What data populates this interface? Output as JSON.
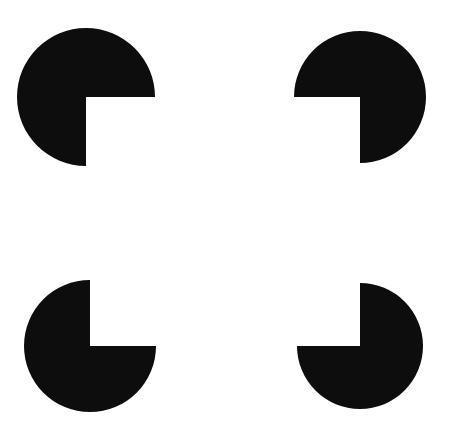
{
  "figure": {
    "type": "illusory-contour-figure",
    "canvas": {
      "width": 450,
      "height": 440,
      "background_color": "#ffffff"
    },
    "shape_color": "#0d0d0d",
    "inducer_count": 4,
    "wedge_angle_degrees": 90,
    "inducers": [
      {
        "name": "top-left",
        "label": "pacman-top-left",
        "center_x": 86,
        "center_y": 97,
        "radius": 69,
        "wedge_start_deg": 0,
        "wedge_end_deg": 90,
        "notch_corner_x": 86,
        "notch_corner_y": 97
      },
      {
        "name": "top-right",
        "label": "pacman-top-right",
        "center_x": 360,
        "center_y": 97,
        "radius": 66,
        "wedge_start_deg": 90,
        "wedge_end_deg": 180,
        "notch_corner_x": 360,
        "notch_corner_y": 97
      },
      {
        "name": "bottom-left",
        "label": "pacman-bottom-left",
        "center_x": 90,
        "center_y": 346,
        "radius": 66,
        "wedge_start_deg": 270,
        "wedge_end_deg": 360,
        "notch_corner_x": 90,
        "notch_corner_y": 346
      },
      {
        "name": "bottom-right",
        "label": "pacman-bottom-right",
        "center_x": 360,
        "center_y": 346,
        "radius": 63,
        "wedge_start_deg": 180,
        "wedge_end_deg": 270,
        "notch_corner_x": 360,
        "notch_corner_y": 346
      }
    ],
    "illusory_square": {
      "label": "illusory-square",
      "left": 86,
      "top": 97,
      "right": 360,
      "bottom": 346,
      "width": 274,
      "height": 249,
      "fill_color": "#ffffff",
      "visible_border": false
    }
  }
}
